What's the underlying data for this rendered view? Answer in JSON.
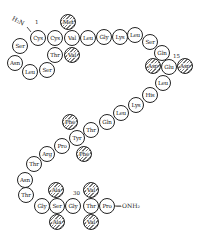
{
  "diagram": {
    "n_terminus": "H₂N",
    "c_terminus": "—ONH₂",
    "position_labels": [
      {
        "text": "1",
        "x": 38,
        "y": 23
      },
      {
        "text": "15",
        "x": 176,
        "y": 57
      },
      {
        "text": "30",
        "x": 76,
        "y": 194
      }
    ],
    "residues": [
      {
        "name": "Cys",
        "x": 38,
        "y": 38,
        "hatched": false
      },
      {
        "name": "Cys",
        "x": 55,
        "y": 38,
        "hatched": false
      },
      {
        "name": "Val",
        "x": 72,
        "y": 38,
        "hatched": false
      },
      {
        "name": "Met",
        "x": 68,
        "y": 22,
        "hatched": true
      },
      {
        "name": "Val",
        "x": 72,
        "y": 55,
        "hatched": true
      },
      {
        "name": "Thr",
        "x": 55,
        "y": 55,
        "hatched": false
      },
      {
        "name": "Ser",
        "x": 20,
        "y": 46,
        "hatched": false
      },
      {
        "name": "Asn",
        "x": 15,
        "y": 63,
        "hatched": false
      },
      {
        "name": "Leu",
        "x": 30,
        "y": 72,
        "hatched": false
      },
      {
        "name": "Ser",
        "x": 47,
        "y": 70,
        "hatched": false
      },
      {
        "name": "Leu",
        "x": 88,
        "y": 38,
        "hatched": false
      },
      {
        "name": "Gly",
        "x": 104,
        "y": 37,
        "hatched": false
      },
      {
        "name": "Lys",
        "x": 120,
        "y": 37,
        "hatched": false
      },
      {
        "name": "Leu",
        "x": 135,
        "y": 35,
        "hatched": false
      },
      {
        "name": "Ser",
        "x": 150,
        "y": 42,
        "hatched": false
      },
      {
        "name": "Gln",
        "x": 162,
        "y": 53,
        "hatched": false
      },
      {
        "name": "Asp",
        "x": 153,
        "y": 66,
        "hatched": true
      },
      {
        "name": "Glu",
        "x": 169,
        "y": 67,
        "hatched": false
      },
      {
        "name": "Asp",
        "x": 185,
        "y": 66,
        "hatched": true
      },
      {
        "name": "Leu",
        "x": 163,
        "y": 83,
        "hatched": false
      },
      {
        "name": "His",
        "x": 150,
        "y": 95,
        "hatched": false
      },
      {
        "name": "Lys",
        "x": 136,
        "y": 105,
        "hatched": false
      },
      {
        "name": "Leu",
        "x": 121,
        "y": 113,
        "hatched": false
      },
      {
        "name": "Gln",
        "x": 107,
        "y": 122,
        "hatched": false
      },
      {
        "name": "Thr",
        "x": 91,
        "y": 130,
        "hatched": false
      },
      {
        "name": "Phe",
        "x": 70,
        "y": 122,
        "hatched": true
      },
      {
        "name": "Tyr",
        "x": 77,
        "y": 138,
        "hatched": false
      },
      {
        "name": "Phe",
        "x": 84,
        "y": 154,
        "hatched": true
      },
      {
        "name": "Pro",
        "x": 62,
        "y": 146,
        "hatched": false
      },
      {
        "name": "Arg",
        "x": 47,
        "y": 154,
        "hatched": false
      },
      {
        "name": "Thr",
        "x": 34,
        "y": 164,
        "hatched": false
      },
      {
        "name": "Asn",
        "x": 25,
        "y": 180,
        "hatched": false
      },
      {
        "name": "Thr",
        "x": 26,
        "y": 195,
        "hatched": false
      },
      {
        "name": "Gly",
        "x": 42,
        "y": 206,
        "hatched": false
      },
      {
        "name": "Ser",
        "x": 57,
        "y": 206,
        "hatched": false
      },
      {
        "name": "Ala",
        "x": 56,
        "y": 190,
        "hatched": true
      },
      {
        "name": "Ala",
        "x": 57,
        "y": 222,
        "hatched": true
      },
      {
        "name": "Gly",
        "x": 73,
        "y": 206,
        "hatched": false
      },
      {
        "name": "Thr",
        "x": 91,
        "y": 206,
        "hatched": false
      },
      {
        "name": "Val",
        "x": 91,
        "y": 190,
        "hatched": true
      },
      {
        "name": "Val",
        "x": 91,
        "y": 222,
        "hatched": true
      },
      {
        "name": "Pro",
        "x": 107,
        "y": 206,
        "hatched": false
      }
    ]
  }
}
